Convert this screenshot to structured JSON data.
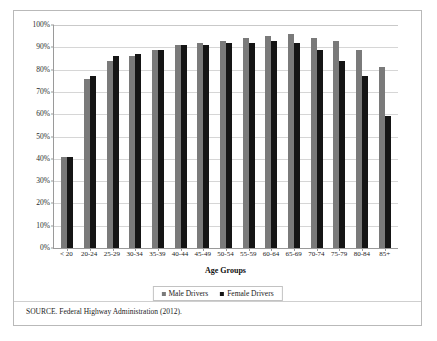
{
  "chart_data": {
    "type": "bar",
    "title": "",
    "xlabel": "Age Groups",
    "ylabel": "",
    "ylim": [
      0,
      100
    ],
    "grid": true,
    "legend_position": "bottom",
    "categories": [
      "< 20",
      "20-24",
      "25-29",
      "30-34",
      "35-39",
      "40-44",
      "45-49",
      "50-54",
      "55-59",
      "60-64",
      "65-69",
      "70-74",
      "75-79",
      "80-84",
      "85+"
    ],
    "ytick_labels": [
      "100%",
      "90%",
      "80%",
      "70%",
      "60%",
      "50%",
      "40%",
      "30%",
      "20%",
      "10%",
      "0%"
    ],
    "ytick_values": [
      100,
      90,
      80,
      70,
      60,
      50,
      40,
      30,
      20,
      10,
      0
    ],
    "series": [
      {
        "name": "Male Drivers",
        "color": "#7a7a7a",
        "values": [
          41,
          76,
          84,
          86,
          89,
          91,
          92,
          93,
          94,
          95,
          96,
          94,
          93,
          89,
          81
        ]
      },
      {
        "name": "Female Drivers",
        "color": "#151515",
        "values": [
          41,
          77,
          86,
          87,
          89,
          91,
          91,
          92,
          92,
          93,
          92,
          89,
          84,
          77,
          59
        ]
      }
    ]
  },
  "source": {
    "note": "SOURCE.  Federal Highway Administration (2012)."
  }
}
